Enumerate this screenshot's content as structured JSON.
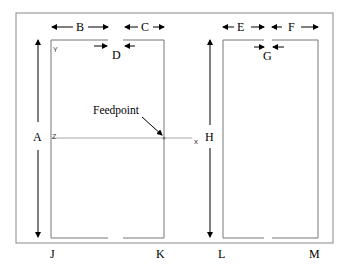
{
  "diagram": {
    "type": "antenna-dimension-diagram",
    "labels": {
      "A": "A",
      "B": "B",
      "C": "C",
      "D": "D",
      "E": "E",
      "F": "F",
      "G": "G",
      "H": "H",
      "J": "J",
      "K": "K",
      "L": "L",
      "M": "M"
    },
    "feedpoint_label": "Feedpoint",
    "axis_markers": {
      "y": "Y",
      "z": "Z",
      "x": "x"
    },
    "colors": {
      "line": "#777777",
      "arrow": "#000000",
      "frame": "#888888"
    }
  }
}
